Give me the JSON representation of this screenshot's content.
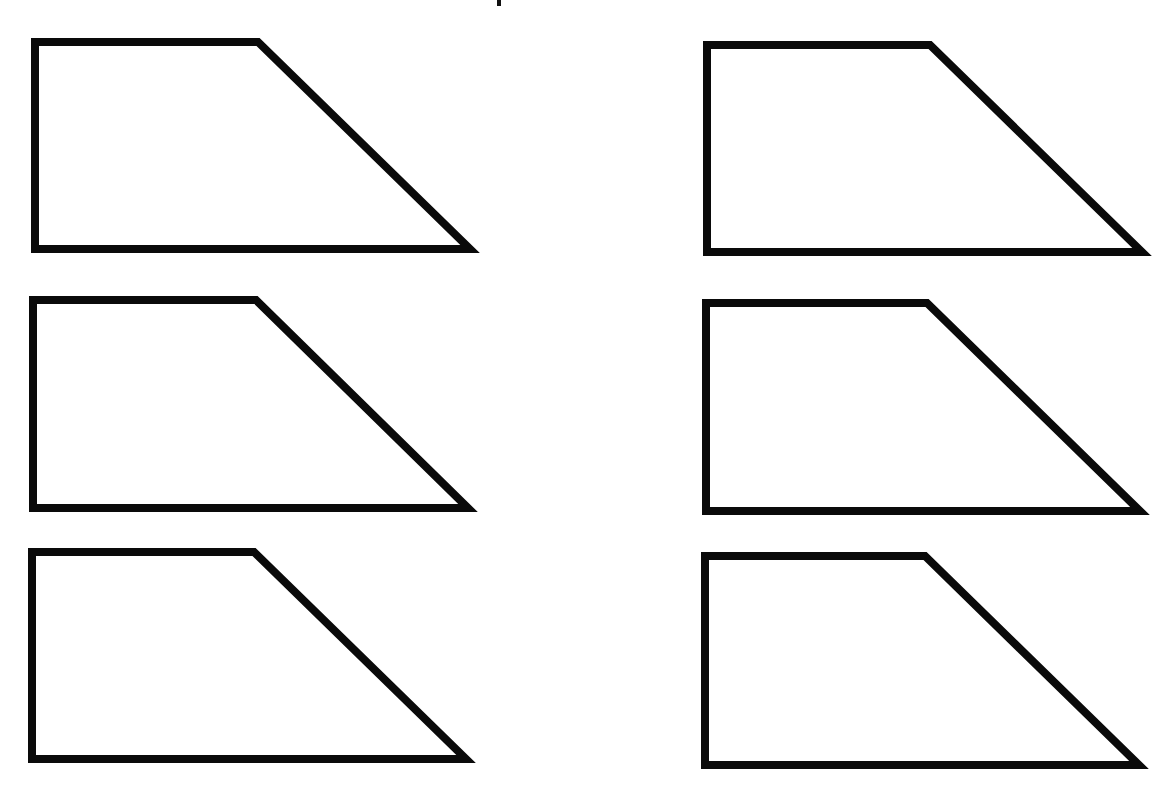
{
  "page": {
    "width": 1169,
    "height": 786,
    "background": "#ffffff"
  },
  "style": {
    "stroke_color": "#0a0a0a",
    "stroke_width": 8,
    "fill_color": "#ffffff"
  },
  "header": {
    "cropped_title_mark": {
      "x": 497,
      "y": 0,
      "width": 4,
      "height": 6
    }
  },
  "grid": {
    "rows": 3,
    "columns": 2
  },
  "shapes": [
    {
      "id": "trapezoid-1",
      "row": 1,
      "column": 1,
      "type": "right-trapezoid",
      "points": "35,42 258,42 470,249 35,249"
    },
    {
      "id": "trapezoid-2",
      "row": 1,
      "column": 2,
      "type": "right-trapezoid",
      "points": "707,45 930,45 1142,252 707,252"
    },
    {
      "id": "trapezoid-3",
      "row": 2,
      "column": 1,
      "type": "right-trapezoid",
      "points": "33,300 256,300 468,508 33,508"
    },
    {
      "id": "trapezoid-4",
      "row": 2,
      "column": 2,
      "type": "right-trapezoid",
      "points": "706,303 927,303 1140,511 706,511"
    },
    {
      "id": "trapezoid-5",
      "row": 3,
      "column": 1,
      "type": "right-trapezoid",
      "points": "32,552 254,552 466,759 32,759"
    },
    {
      "id": "trapezoid-6",
      "row": 3,
      "column": 2,
      "type": "right-trapezoid",
      "points": "705,556 925,556 1139,765 705,765"
    }
  ]
}
